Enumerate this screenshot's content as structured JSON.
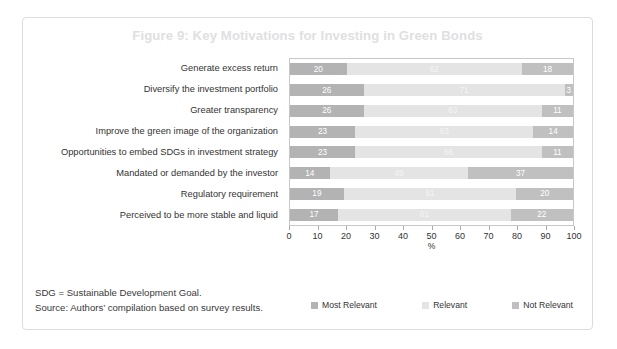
{
  "figure": {
    "title": "Figure 9: Key Motivations for Investing in Green Bonds",
    "notes": [
      "SDG = Sustainable Development Goal.",
      "Source: Authors’ compilation based on survey results."
    ]
  },
  "chart_data": {
    "type": "bar",
    "orientation": "horizontal",
    "stacked": true,
    "title": "Figure 9: Key Motivations for Investing in Green Bonds",
    "xlabel": "%",
    "ylabel": "",
    "xlim": [
      0,
      100
    ],
    "xticks": [
      "0",
      "10",
      "20",
      "30",
      "40",
      "50",
      "60",
      "70",
      "80",
      "90",
      "100"
    ],
    "grid": false,
    "legend_position": "bottom",
    "categories": [
      "Generate excess return",
      "Diversify the investment portfolio",
      "Greater transparency",
      "Improve the green image of the organization",
      "Opportunities to embed SDGs in investment strategy",
      "Mandated or demanded by the investor",
      "Regulatory requirement",
      "Perceived to be more stable and liquid"
    ],
    "series": [
      {
        "name": "Most Relevant",
        "color": "#b3b3b3",
        "values": [
          20,
          26,
          26,
          23,
          23,
          14,
          19,
          17
        ]
      },
      {
        "name": "Relevant",
        "color": "#e4e4e4",
        "values": [
          62,
          71,
          63,
          63,
          66,
          49,
          61,
          61
        ]
      },
      {
        "name": "Not Relevant",
        "color": "#c0c0c0",
        "values": [
          18,
          3,
          11,
          14,
          11,
          37,
          20,
          22
        ]
      }
    ]
  }
}
